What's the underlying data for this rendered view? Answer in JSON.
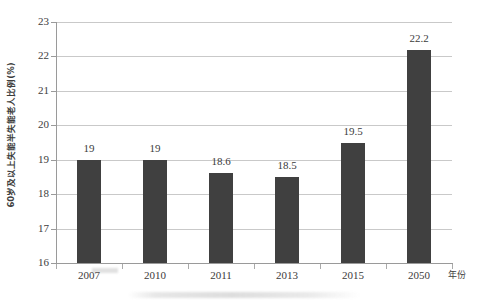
{
  "chart_data": {
    "type": "bar",
    "title": "",
    "xlabel": "年份",
    "ylabel": "60岁及以上失能半失能老人比例(%)",
    "categories": [
      "2007",
      "2010",
      "2011",
      "2013",
      "2015",
      "2050"
    ],
    "values": [
      19,
      19,
      18.6,
      18.5,
      19.5,
      22.2
    ],
    "value_labels": [
      "19",
      "19",
      "18.6",
      "18.5",
      "19.5",
      "22.2"
    ],
    "ylim": [
      16,
      23
    ],
    "ytick_step": 1,
    "yticks": [
      "23",
      "22",
      "21",
      "20",
      "19",
      "18",
      "17",
      "16"
    ],
    "ytick_values": [
      23,
      22,
      21,
      20,
      19,
      18,
      17,
      16
    ],
    "grid": "horizontal",
    "legend": "none",
    "bar_color": "#404040",
    "gridline_color": "#c9c9c9",
    "axis_color": "#9a9a9a",
    "background_color": "#ffffff"
  }
}
